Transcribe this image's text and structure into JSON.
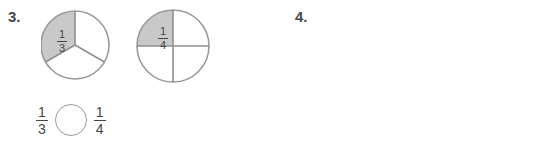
{
  "page": {
    "background": "#ffffff",
    "text_color": "#3c3c3c",
    "shade_color": "#c9c9c9",
    "line_color": "#9d9d9d"
  },
  "problems": [
    {
      "number": "3.",
      "models": [
        {
          "type": "circle",
          "name": "thirds-circle",
          "total_parts": 3,
          "shaded_parts": 1,
          "label_numerator": "1",
          "label_denominator": "3"
        },
        {
          "type": "circle",
          "name": "fourths-circle",
          "total_parts": 4,
          "shaded_parts": 1,
          "label_numerator": "1",
          "label_denominator": "4"
        }
      ],
      "comparison": {
        "left_numerator": "1",
        "left_denominator": "3",
        "right_numerator": "1",
        "right_denominator": "4",
        "operator": ""
      }
    },
    {
      "number": "4.",
      "models": [
        {
          "type": "bar",
          "name": "sixths-bar",
          "total_parts": 6,
          "shaded_parts": 2,
          "label_numerator": "1",
          "label_denominator": "6"
        },
        {
          "type": "bar",
          "name": "eighths-bar",
          "total_parts": 8,
          "shaded_parts": 2,
          "label_numerator": "1",
          "label_denominator": "8"
        }
      ],
      "comparison": {
        "left_numerator": "2",
        "left_denominator": "8",
        "right_numerator": "2",
        "right_denominator": "6",
        "operator": ""
      }
    }
  ]
}
